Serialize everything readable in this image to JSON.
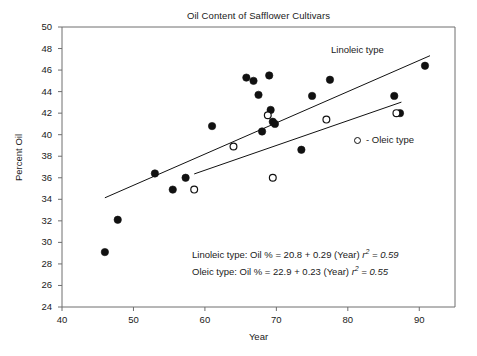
{
  "chart_data": {
    "type": "scatter",
    "title": "Oil Content of Safflower Cultivars",
    "xlabel": "Year",
    "ylabel": "Percent Oil",
    "xlim": [
      40,
      95
    ],
    "ylim": [
      24,
      50
    ],
    "xticks": [
      40,
      50,
      60,
      70,
      80,
      90
    ],
    "yticks": [
      24,
      26,
      28,
      30,
      32,
      34,
      36,
      38,
      40,
      42,
      44,
      46,
      48,
      50
    ],
    "grid": false,
    "legend_position": "inside-right",
    "series": [
      {
        "name": "Linoleic type",
        "marker": "filled-circle",
        "color": "#111111",
        "points": [
          {
            "x": 46.0,
            "y": 29.1
          },
          {
            "x": 47.8,
            "y": 32.1
          },
          {
            "x": 53.0,
            "y": 36.4
          },
          {
            "x": 55.5,
            "y": 34.9
          },
          {
            "x": 57.3,
            "y": 36.0
          },
          {
            "x": 61.0,
            "y": 40.8
          },
          {
            "x": 65.8,
            "y": 45.3
          },
          {
            "x": 66.8,
            "y": 45.0
          },
          {
            "x": 67.5,
            "y": 43.7
          },
          {
            "x": 68.0,
            "y": 40.3
          },
          {
            "x": 69.0,
            "y": 45.5
          },
          {
            "x": 69.2,
            "y": 42.3
          },
          {
            "x": 69.5,
            "y": 41.2
          },
          {
            "x": 69.8,
            "y": 41.0
          },
          {
            "x": 73.5,
            "y": 38.6
          },
          {
            "x": 75.0,
            "y": 43.6
          },
          {
            "x": 77.5,
            "y": 45.1
          },
          {
            "x": 86.5,
            "y": 43.6
          },
          {
            "x": 87.3,
            "y": 42.0
          },
          {
            "x": 90.8,
            "y": 46.4
          }
        ]
      },
      {
        "name": "Oleic type",
        "marker": "open-circle",
        "color": "#111111",
        "points": [
          {
            "x": 58.5,
            "y": 34.9
          },
          {
            "x": 64.0,
            "y": 38.9
          },
          {
            "x": 68.8,
            "y": 41.8
          },
          {
            "x": 69.5,
            "y": 36.0
          },
          {
            "x": 77.0,
            "y": 41.4
          },
          {
            "x": 86.8,
            "y": 42.0
          }
        ]
      }
    ],
    "trendlines": [
      {
        "name": "Linoleic type",
        "intercept": 20.8,
        "slope": 0.29,
        "r2": 0.59,
        "x_start": 46.0,
        "x_end": 91.5
      },
      {
        "name": "Oleic type",
        "intercept": 22.9,
        "slope": 0.23,
        "r2": 0.55,
        "x_start": 58.5,
        "x_end": 87.5
      }
    ],
    "annotations": {
      "linoleic_label": "Linoleic type",
      "oleic_legend": "- Oleic type",
      "equation_linoleic_text": "Linoleic type: Oil % = 20.8 + 0.29 (Year) ",
      "equation_linoleic_r": "r",
      "equation_linoleic_sup": "2",
      "equation_linoleic_value": " = 0.59",
      "equation_oleic_text": "Oleic type: Oil % = 22.9 + 0.23 (Year) ",
      "equation_oleic_r": "r",
      "equation_oleic_sup": "2",
      "equation_oleic_value": " = 0.55"
    }
  },
  "colors": {
    "axis": "#6e6e6e",
    "marker": "#111111",
    "text": "#1a1a1a",
    "background": "#ffffff"
  }
}
